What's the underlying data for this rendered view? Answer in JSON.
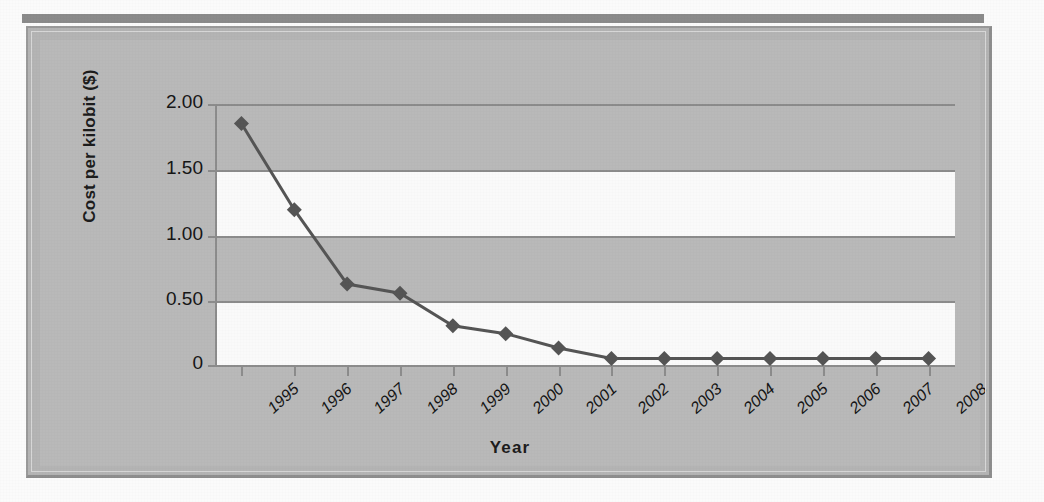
{
  "chart_data": {
    "type": "line",
    "title": "",
    "xlabel": "Year",
    "ylabel": "Cost per kilobit ($)",
    "categories": [
      "1995",
      "1996",
      "1997",
      "1998",
      "1999",
      "2000",
      "2001",
      "2002",
      "2003",
      "2004",
      "2005",
      "2006",
      "2007",
      "2008"
    ],
    "values": [
      1.85,
      1.19,
      0.62,
      0.55,
      0.3,
      0.24,
      0.13,
      0.05,
      0.05,
      0.05,
      0.05,
      0.05,
      0.05,
      0.05
    ],
    "series": [
      {
        "name": "Cost per kilobit",
        "values": [
          1.85,
          1.19,
          0.62,
          0.55,
          0.3,
          0.24,
          0.13,
          0.05,
          0.05,
          0.05,
          0.05,
          0.05,
          0.05,
          0.05
        ]
      }
    ],
    "ylim": [
      0,
      2.0
    ],
    "ytick_labels": [
      "2.00",
      "1.50",
      "1.00",
      "0.50",
      "0"
    ],
    "ytick_values": [
      2.0,
      1.5,
      1.0,
      0.5,
      0
    ],
    "grid": true,
    "legend": false,
    "legend_position": "none",
    "marker": "diamond",
    "line_color": "#555555",
    "marker_color": "#555555",
    "plot_band_colors": [
      "#b9b9b9",
      "#fafafa"
    ],
    "panel_color": "#b9b9b9",
    "axis_color": "#8c8c8c",
    "text_color": "#161616"
  },
  "background_artifacts": {
    "ghost_text": [
      "The printed World Wide Web for the snap that has contributed",
      "bject Today, more than 2.2 million Web users are in the world"
    ]
  }
}
